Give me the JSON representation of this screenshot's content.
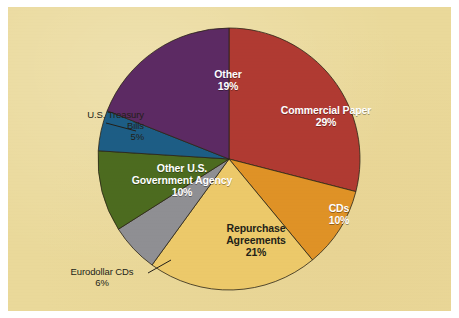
{
  "figure": {
    "background_color": "#ead99a",
    "frame_color": "#ffffff"
  },
  "chart_data": {
    "type": "pie",
    "title": "",
    "subtitle": "",
    "xlabel": "",
    "ylabel": "",
    "legend_position": "none",
    "start_angle_deg": 0,
    "direction": "clockwise",
    "units": "percent",
    "total": 100,
    "categories": [
      "Commercial Paper",
      "CDs",
      "Repurchase Agreements",
      "Eurodollar CDs",
      "Other U.S. Government Agency",
      "U.S. Treasury Bills",
      "Other"
    ],
    "values": [
      29,
      10,
      21,
      6,
      10,
      5,
      19
    ],
    "colors": [
      "#b03a32",
      "#df9226",
      "#ecc96a",
      "#8f8f93",
      "#4c6b1f",
      "#1d5d85",
      "#5c2a63"
    ],
    "slices": [
      {
        "label": "Commercial Paper",
        "value": 29,
        "value_text": "29%",
        "color": "#b03a32",
        "label_placement": "inside",
        "label_color": "#ffffff"
      },
      {
        "label": "CDs",
        "value": 10,
        "value_text": "10%",
        "color": "#df9226",
        "label_placement": "inside",
        "label_color": "#ffffff"
      },
      {
        "label": "Repurchase Agreements",
        "value": 21,
        "value_text": "21%",
        "color": "#ecc96a",
        "label_placement": "inside",
        "label_color": "#231f18"
      },
      {
        "label": "Eurodollar CDs",
        "value": 6,
        "value_text": "6%",
        "color": "#8f8f93",
        "label_placement": "outside",
        "label_color": "#231f18"
      },
      {
        "label": "Other U.S. Government Agency",
        "value": 10,
        "value_text": "10%",
        "color": "#4c6b1f",
        "label_placement": "inside",
        "label_color": "#ffffff"
      },
      {
        "label": "U.S. Treasury Bills",
        "value": 5,
        "value_text": "5%",
        "color": "#1d5d85",
        "label_placement": "outside",
        "label_color": "#231f18"
      },
      {
        "label": "Other",
        "value": 19,
        "value_text": "19%",
        "color": "#5c2a63",
        "label_placement": "inside",
        "label_color": "#ffffff"
      }
    ]
  },
  "labels": {
    "commercial_paper": {
      "name": "Commercial Paper",
      "pct": "29%"
    },
    "cds": {
      "name": "CDs",
      "pct": "10%"
    },
    "repurchase": {
      "line1": "Repurchase",
      "line2": "Agreements",
      "pct": "21%"
    },
    "eurodollar": {
      "name": "Eurodollar CDs",
      "pct": "6%"
    },
    "govt_agency": {
      "line1": "Other U.S.",
      "line2": "Government Agency",
      "pct": "10%"
    },
    "treasury": {
      "line1": "U.S. Treasury",
      "line2": "Bills",
      "pct": "5%"
    },
    "other": {
      "name": "Other",
      "pct": "19%"
    }
  }
}
